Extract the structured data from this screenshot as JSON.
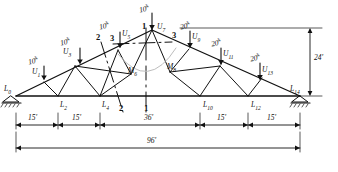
{
  "diagram": {
    "ink_color": "#111111",
    "span_label": "96'",
    "height_label": "24'",
    "center_panel_label": "36'",
    "end_panel_label": "15'"
  },
  "loads": [
    {
      "id": "load-u1",
      "text": "10",
      "unit": "k",
      "node": "U1",
      "x": 29,
      "y": 61,
      "arrow_x": 44,
      "arrow_y0": 64,
      "arrow_y1": 78
    },
    {
      "id": "load-u3",
      "text": "10",
      "unit": "k",
      "node": "U3",
      "x": 80,
      "y": 42,
      "arrow_x": 80,
      "arrow_y0": 45,
      "arrow_y1": 62
    },
    {
      "id": "load-u5",
      "text": "10",
      "unit": "k",
      "node": "U5",
      "x": 111,
      "y": 26,
      "arrow_x": 118,
      "arrow_y0": 29,
      "arrow_y1": 46
    },
    {
      "id": "load-u7",
      "text": "10",
      "unit": "k",
      "node": "U7",
      "x": 146,
      "y": 8,
      "arrow_x": 150,
      "arrow_y0": 11,
      "arrow_y1": 30
    },
    {
      "id": "load-u9",
      "text": "20",
      "unit": "k",
      "node": "U9",
      "x": 182,
      "y": 25,
      "arrow_x": 189,
      "arrow_y0": 28,
      "arrow_y1": 44
    },
    {
      "id": "load-u11",
      "text": "20",
      "unit": "k",
      "node": "U11",
      "x": 213,
      "y": 42,
      "arrow_x": 220,
      "arrow_y0": 45,
      "arrow_y1": 61
    },
    {
      "id": "load-u13",
      "text": "20",
      "unit": "k",
      "node": "U13",
      "x": 251,
      "y": 58,
      "arrow_x": 258,
      "arrow_y0": 61,
      "arrow_y1": 77
    }
  ],
  "top_nodes": [
    {
      "id": "node-u1",
      "base": "U",
      "index": "1",
      "x": 36,
      "y": 70
    },
    {
      "id": "node-u3",
      "base": "U",
      "index": "3",
      "x": 68,
      "y": 51
    },
    {
      "id": "node-u5",
      "base": "U",
      "index": "5",
      "x": 121,
      "y": 34
    },
    {
      "id": "node-u7",
      "base": "U",
      "index": "7",
      "x": 158,
      "y": 25
    },
    {
      "id": "node-u9",
      "base": "U",
      "index": "9",
      "x": 193,
      "y": 35
    },
    {
      "id": "node-u11",
      "base": "U",
      "index": "11",
      "x": 224,
      "y": 53
    },
    {
      "id": "node-u13",
      "base": "U",
      "index": "13",
      "x": 263,
      "y": 70
    }
  ],
  "mid_nodes": [
    {
      "id": "node-m6",
      "base": "M",
      "index": "6",
      "x": 131,
      "y": 69
    },
    {
      "id": "node-m8",
      "base": "M",
      "index": "8",
      "x": 170,
      "y": 66
    }
  ],
  "bottom_nodes": [
    {
      "id": "node-l0",
      "base": "L",
      "index": "0",
      "x": 10,
      "y": 89
    },
    {
      "id": "node-l2",
      "base": "L",
      "index": "2",
      "x": 64,
      "y": 105
    },
    {
      "id": "node-l4",
      "base": "L",
      "index": "4",
      "x": 105,
      "y": 105
    },
    {
      "id": "node-l10",
      "base": "L",
      "index": "10",
      "x": 206,
      "y": 105
    },
    {
      "id": "node-l12",
      "base": "L",
      "index": "12",
      "x": 254,
      "y": 105
    },
    {
      "id": "node-l14",
      "base": "L",
      "index": "14",
      "x": 295,
      "y": 89
    }
  ],
  "sections": [
    {
      "id": "section-1-top",
      "text": "1",
      "x": 142,
      "y": 27
    },
    {
      "id": "section-1-bottom",
      "text": "1",
      "x": 145,
      "y": 105
    },
    {
      "id": "section-2-top",
      "text": "2",
      "x": 98,
      "y": 37
    },
    {
      "id": "section-2-bottom",
      "text": "2",
      "x": 120,
      "y": 106
    },
    {
      "id": "section-3-top",
      "text": "3",
      "x": 111,
      "y": 39
    },
    {
      "id": "section-3-right",
      "text": "3",
      "x": 173,
      "y": 35
    }
  ],
  "dimensions": {
    "horizontal": [
      {
        "id": "dim-15-a",
        "label": "15'",
        "x": 32,
        "y": 119
      },
      {
        "id": "dim-15-b",
        "label": "15'",
        "x": 80,
        "y": 119
      },
      {
        "id": "dim-36",
        "label": "36'",
        "x": 150,
        "y": 119
      },
      {
        "id": "dim-15-c",
        "label": "15'",
        "x": 225,
        "y": 119
      },
      {
        "id": "dim-15-d",
        "label": "15'",
        "x": 268,
        "y": 119
      }
    ],
    "overall": {
      "id": "dim-96",
      "label": "96'",
      "x": 150,
      "y": 140
    },
    "vertical": {
      "id": "dim-24",
      "label": "24'",
      "x": 315,
      "y": 55
    }
  }
}
